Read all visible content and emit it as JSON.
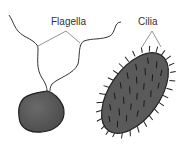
{
  "diagram": {
    "labels": {
      "flagella": "Flagella",
      "cilia": "Cilia"
    },
    "cells": [
      {
        "name": "flagellated-cell",
        "label": "Flagella",
        "flagella_count": 2
      },
      {
        "name": "ciliated-cell",
        "label": "Cilia"
      }
    ],
    "colors": {
      "cell_fill": "#5a5a5a",
      "outline": "#222222",
      "line": "#444444",
      "label_line": "#777777",
      "background": "#ffffff"
    }
  }
}
